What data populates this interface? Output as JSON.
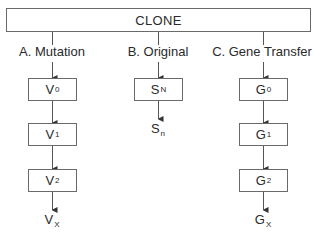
{
  "root": {
    "label": "CLONE"
  },
  "branches": [
    {
      "id": "A",
      "label": "A.  Mutation",
      "nodes": [
        {
          "base": "V",
          "sub": "0"
        },
        {
          "base": "V",
          "sub": "1"
        },
        {
          "base": "V",
          "sub": "2"
        }
      ],
      "terminal": {
        "base": "V",
        "sub": "X"
      }
    },
    {
      "id": "B",
      "label": "B.  Original",
      "nodes": [
        {
          "base": "S",
          "sub": "N"
        }
      ],
      "terminal": {
        "base": "S",
        "sub": "n"
      }
    },
    {
      "id": "C",
      "label": "C. Gene Transfer",
      "nodes": [
        {
          "base": "G",
          "sub": "0"
        },
        {
          "base": "G",
          "sub": "1"
        },
        {
          "base": "G",
          "sub": "2"
        }
      ],
      "terminal": {
        "base": "G",
        "sub": "X"
      }
    }
  ],
  "colors": {
    "line": "#555555",
    "text": "#2a2a2a",
    "border": "#6a6a6a"
  }
}
